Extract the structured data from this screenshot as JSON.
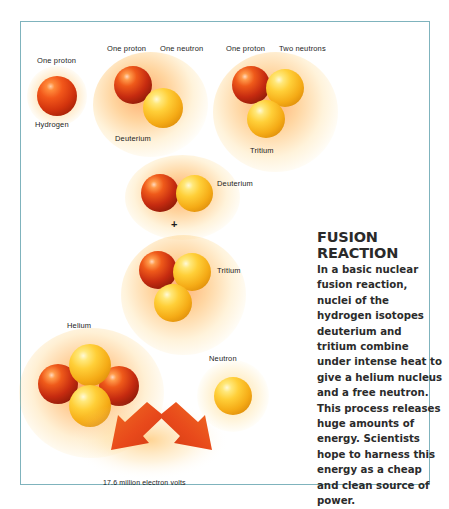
{
  "figure": {
    "border_color": "#7fb3bd",
    "background": "#ffffff"
  },
  "palette": {
    "proton": "#c62b10",
    "neutron": "#ffcf38",
    "glow": "#ff8a1e",
    "arrow": "#e8491b",
    "title_text": "#2a2a2a",
    "body_text": "#2b2b2b",
    "label_text": "#1c1c1c"
  },
  "diagram": {
    "hydrogen": {
      "particle_label": "One proton",
      "name_label": "Hydrogen"
    },
    "deuterium_top": {
      "proton_label": "One proton",
      "neutron_label": "One neutron",
      "name_label": "Deuterium"
    },
    "tritium_top": {
      "proton_label": "One proton",
      "neutron_label": "Two neutrons",
      "name_label": "Tritium"
    },
    "reaction": {
      "deuterium_label": "Deuterium",
      "plus_symbol": "+",
      "tritium_label": "Tritium"
    },
    "products": {
      "helium_label": "Helium",
      "neutron_label": "Neutron",
      "energy_label": "17.6 million electron volts"
    }
  },
  "article": {
    "title": "FUSION REACTION",
    "body": "In a basic nuclear fusion reaction, nuclei of the hydrogen isotopes deuterium and tritium combine under intense heat to give a helium nucleus and a free neutron. This process releases huge amounts of energy. Scientists hope to harness this energy as a cheap and clean source of power."
  }
}
